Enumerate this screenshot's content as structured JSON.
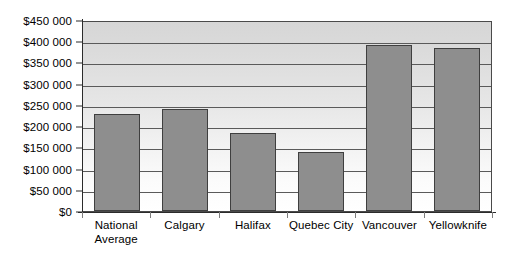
{
  "chart_data": {
    "type": "bar",
    "title": "",
    "subtitle": "",
    "xlabel": "",
    "ylabel": "",
    "categories": [
      "National\nAverage",
      "Calgary",
      "Halifax",
      "Quebec City",
      "Vancouver",
      "Yellowknife"
    ],
    "values": [
      228000,
      241000,
      184000,
      140000,
      392000,
      384000
    ],
    "ylim": [
      0,
      450000
    ],
    "ytick_values": [
      0,
      50000,
      100000,
      150000,
      200000,
      250000,
      300000,
      350000,
      400000,
      450000
    ],
    "ytick_labels": [
      "$0",
      "$50 000",
      "$100 000",
      "$150 000",
      "$200 000",
      "$250 000",
      "$300 000",
      "$350 000",
      "$400 000",
      "$450 000"
    ],
    "grid": true,
    "grid_axis": "y",
    "legend": false,
    "legend_position": "none",
    "bar_color": "#8e8e8e",
    "bar_border_color": "#3f3f3f",
    "plot_background_gradient_top": "#d6d6d6",
    "plot_background_gradient_bottom": "#ffffff",
    "gridline_color": "#5a5a5a",
    "axis_color": "#2b2b2b",
    "text_color": "#000000"
  }
}
